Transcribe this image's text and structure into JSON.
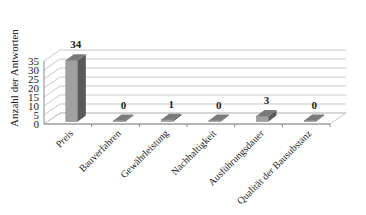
{
  "chart_data": {
    "type": "bar",
    "title": "",
    "xlabel": "",
    "ylabel": "Anzahl der Antworten",
    "ylim": [
      0,
      35
    ],
    "yticks": [
      0,
      5,
      10,
      15,
      20,
      25,
      30,
      35
    ],
    "grid": true,
    "legend": "none",
    "style": "3d-column",
    "categories": [
      "Preis",
      "Bauverfahren",
      "Gewährleistung",
      "Nachhaltigkeit",
      "Ausführungsdauer",
      "Qualität der Bausubstanz"
    ],
    "values": [
      34,
      0,
      1,
      0,
      3,
      0
    ],
    "data_labels": [
      "34",
      "0",
      "1",
      "0",
      "3",
      "0"
    ]
  },
  "colors": {
    "bar_front": "#a0a0a0",
    "bar_side": "#5a5a5a",
    "bar_top": "#7a7a7a",
    "grid": "#c8c8c8",
    "axis": "#888888",
    "text": "#222222"
  }
}
